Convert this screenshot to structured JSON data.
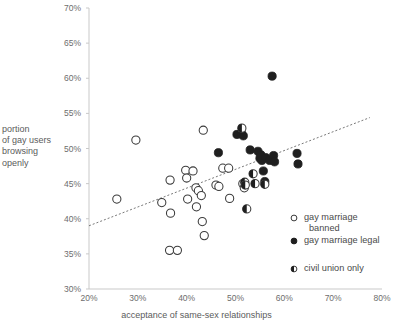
{
  "chart_data": {
    "type": "scatter",
    "title": "",
    "xlabel": "acceptance of same-sex relationships",
    "ylabel": "portion of gay users browsing openly",
    "ylabel_lines": [
      "portion",
      "of gay users",
      "browsing",
      "openly"
    ],
    "xlim": [
      20,
      80
    ],
    "ylim": [
      30,
      70
    ],
    "xticks": [
      "20%",
      "30%",
      "40%",
      "50%",
      "60%",
      "70%",
      "80%"
    ],
    "xtick_values": [
      20,
      30,
      40,
      50,
      60,
      70,
      80
    ],
    "yticks": [
      "30%",
      "35%",
      "40%",
      "45%",
      "50%",
      "55%",
      "60%",
      "65%",
      "70%"
    ],
    "ytick_values": [
      30,
      35,
      40,
      45,
      50,
      55,
      60,
      65,
      70
    ],
    "grid": false,
    "legend_position": "bottom-right",
    "trendline": {
      "x0": 20,
      "y0": 39.0,
      "x1": 77.5,
      "y1": 54.4,
      "style": "dotted"
    },
    "series": [
      {
        "name": "gay marriage banned",
        "marker": "open-circle",
        "color": "#ffffff",
        "edge_color": "#3a3a3a",
        "points": [
          [
            25.7,
            42.8
          ],
          [
            29.6,
            51.2
          ],
          [
            34.9,
            42.3
          ],
          [
            36.6,
            45.5
          ],
          [
            36.7,
            40.8
          ],
          [
            36.5,
            35.5
          ],
          [
            38.1,
            35.5
          ],
          [
            39.8,
            46.9
          ],
          [
            40.0,
            45.8
          ],
          [
            40.2,
            42.8
          ],
          [
            41.3,
            46.8
          ],
          [
            41.9,
            44.4
          ],
          [
            42.0,
            41.7
          ],
          [
            42.4,
            44.0
          ],
          [
            43.0,
            43.3
          ],
          [
            43.2,
            39.6
          ],
          [
            43.4,
            52.6
          ],
          [
            43.6,
            37.6
          ],
          [
            46.0,
            44.8
          ],
          [
            46.6,
            44.6
          ],
          [
            47.4,
            47.2
          ],
          [
            48.6,
            47.2
          ],
          [
            48.8,
            42.9
          ],
          [
            51.5,
            45.0
          ],
          [
            51.8,
            44.4
          ]
        ]
      },
      {
        "name": "gay marriage legal",
        "marker": "filled-circle",
        "color": "#1f1f1f",
        "edge_color": "#1f1f1f",
        "points": [
          [
            46.5,
            49.4
          ],
          [
            50.3,
            52.0
          ],
          [
            51.2,
            52.2
          ],
          [
            51.6,
            51.8
          ],
          [
            53.0,
            49.8
          ],
          [
            54.6,
            49.6
          ],
          [
            55.0,
            48.6
          ],
          [
            55.2,
            49.1
          ],
          [
            55.4,
            48.3
          ],
          [
            55.7,
            46.8
          ],
          [
            56.0,
            45.3
          ],
          [
            56.2,
            48.7
          ],
          [
            57.0,
            48.3
          ],
          [
            57.5,
            60.3
          ],
          [
            57.8,
            49.0
          ],
          [
            58.0,
            48.1
          ],
          [
            62.6,
            49.3
          ],
          [
            62.8,
            47.8
          ]
        ]
      },
      {
        "name": "civil union only",
        "marker": "half-filled-circle",
        "color": "#1f1f1f",
        "edge_color": "#3a3a3a",
        "points": [
          [
            51.3,
            52.9
          ],
          [
            51.9,
            45.2
          ],
          [
            52.0,
            44.8
          ],
          [
            52.3,
            41.4
          ],
          [
            53.6,
            46.4
          ],
          [
            54.0,
            45.0
          ],
          [
            56.0,
            44.9
          ]
        ]
      }
    ]
  },
  "legend": {
    "items": [
      {
        "label_line1": "gay marriage",
        "label_line2": "banned",
        "marker": "open-circle"
      },
      {
        "label_line1": "gay marriage legal",
        "label_line2": "",
        "marker": "filled-circle"
      },
      {
        "label_line1": "civil union only",
        "label_line2": "",
        "marker": "half-filled-circle"
      }
    ]
  }
}
